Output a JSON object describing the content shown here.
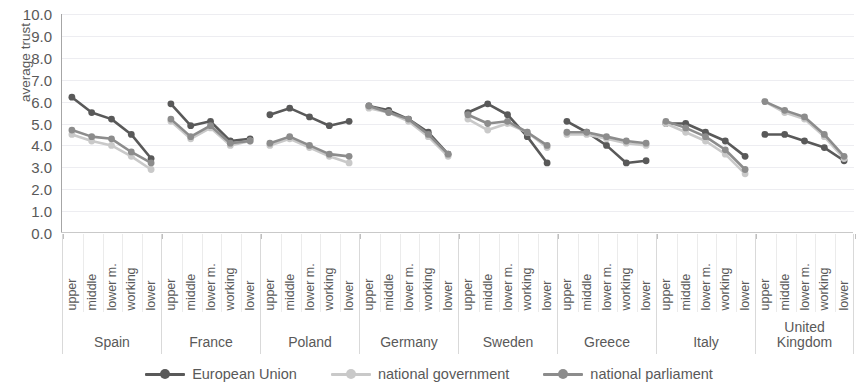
{
  "chart_data": {
    "type": "line",
    "title": "",
    "xlabel": "",
    "ylabel": "average trust",
    "ylim": [
      0,
      10
    ],
    "ytick_step": 1,
    "grid": true,
    "legend_position": "bottom",
    "y_ticks": [
      "0.0",
      "1.0",
      "2.0",
      "3.0",
      "4.0",
      "5.0",
      "6.0",
      "7.0",
      "8.0",
      "9.0",
      "10.0"
    ],
    "classes": [
      "upper",
      "middle",
      "lower m.",
      "working",
      "lower"
    ],
    "countries": [
      "Spain",
      "France",
      "Poland",
      "Germany",
      "Sweden",
      "Greece",
      "Italy",
      "United Kingdom"
    ],
    "series": [
      {
        "name": "European Union",
        "color": "#595959",
        "values_by_country": {
          "Spain": [
            6.2,
            5.5,
            5.2,
            4.5,
            3.4
          ],
          "France": [
            5.9,
            4.9,
            5.1,
            4.2,
            4.3
          ],
          "Poland": [
            5.4,
            5.7,
            5.3,
            4.9,
            5.1
          ],
          "Germany": [
            5.8,
            5.6,
            5.2,
            4.6,
            3.6
          ],
          "Sweden": [
            5.5,
            5.9,
            5.4,
            4.4,
            3.2
          ],
          "Greece": [
            5.1,
            4.6,
            4.0,
            3.2,
            3.3
          ],
          "Italy": [
            5.0,
            5.0,
            4.6,
            4.2,
            3.5
          ],
          "United Kingdom": [
            4.5,
            4.5,
            4.2,
            3.9,
            3.3
          ]
        }
      },
      {
        "name": "national government",
        "color": "#c9c9c9",
        "values_by_country": {
          "Spain": [
            4.5,
            4.2,
            4.0,
            3.5,
            2.9
          ],
          "France": [
            5.1,
            4.3,
            4.8,
            4.0,
            4.2
          ],
          "Poland": [
            4.0,
            4.3,
            3.9,
            3.5,
            3.2
          ],
          "Germany": [
            5.7,
            5.5,
            5.1,
            4.4,
            3.5
          ],
          "Sweden": [
            5.2,
            4.7,
            5.0,
            4.6,
            3.9
          ],
          "Greece": [
            4.5,
            4.5,
            4.3,
            4.1,
            4.0
          ],
          "Italy": [
            5.0,
            4.6,
            4.2,
            3.6,
            2.7
          ],
          "United Kingdom": [
            6.0,
            5.5,
            5.2,
            4.4,
            3.4
          ]
        }
      },
      {
        "name": "national parliament",
        "color": "#8c8c8c",
        "values_by_country": {
          "Spain": [
            4.7,
            4.4,
            4.3,
            3.7,
            3.2
          ],
          "France": [
            5.2,
            4.4,
            4.9,
            4.1,
            4.2
          ],
          "Poland": [
            4.1,
            4.4,
            4.0,
            3.6,
            3.5
          ],
          "Germany": [
            5.8,
            5.5,
            5.2,
            4.5,
            3.6
          ],
          "Sweden": [
            5.4,
            5.0,
            5.1,
            4.6,
            4.0
          ],
          "Greece": [
            4.6,
            4.6,
            4.4,
            4.2,
            4.1
          ],
          "Italy": [
            5.1,
            4.8,
            4.4,
            3.8,
            2.9
          ],
          "United Kingdom": [
            6.0,
            5.6,
            5.3,
            4.5,
            3.5
          ]
        }
      }
    ]
  },
  "legend": {
    "items": [
      {
        "label": "European Union",
        "color": "#595959"
      },
      {
        "label": "national government",
        "color": "#c9c9c9"
      },
      {
        "label": "national parliament",
        "color": "#8c8c8c"
      }
    ]
  },
  "axis": {
    "y_title": "average trust"
  }
}
